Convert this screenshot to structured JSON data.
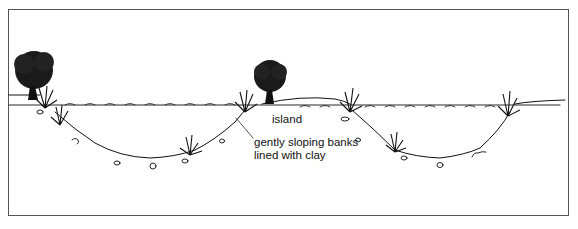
{
  "diagram": {
    "type": "cross-section illustration",
    "labels": {
      "island": "island",
      "banks_line1": "gently sloping banks",
      "banks_line2": "lined with clay"
    },
    "elements": [
      "tree-left",
      "tree-island",
      "reeds",
      "water-surface",
      "pond-bed",
      "pebbles"
    ],
    "colors": {
      "ink": "#111111",
      "frame": "#555555",
      "background": "#ffffff"
    }
  }
}
